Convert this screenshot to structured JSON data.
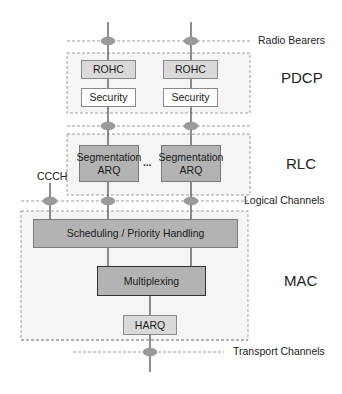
{
  "layers": {
    "pdcp": "PDCP",
    "rlc": "RLC",
    "mac": "MAC"
  },
  "interfaces": {
    "radio_bearers": "Radio Bearers",
    "logical_channels": "Logical Channels",
    "transport_channels": "Transport Channels"
  },
  "pdcp_blocks": {
    "left": {
      "rohc": "ROHC",
      "security": "Security"
    },
    "right": {
      "rohc": "ROHC",
      "security": "Security"
    }
  },
  "rlc_blocks": {
    "left": {
      "line1": "Segmentation",
      "line2": "ARQ"
    },
    "ellipsis": "...",
    "right": {
      "line1": "Segmentation",
      "line2": "ARQ"
    }
  },
  "ccch_label": "CCCH",
  "mac_blocks": {
    "scheduling": "Scheduling / Priority Handling",
    "multiplexing": "Multiplexing",
    "harq": "HARQ"
  },
  "colors": {
    "dark_fill": "#b3b3b3",
    "light_fill": "#dcdcdc",
    "white_fill": "#ffffff",
    "group_fill": "#f4f4f4",
    "ellipse_fill": "#9a9a9a",
    "line": "#444444",
    "dash": "#999999"
  }
}
